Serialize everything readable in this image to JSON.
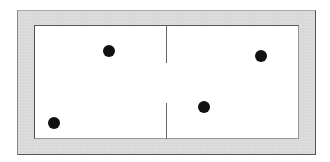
{
  "diagram": {
    "colors": {
      "frame": "#d9d9d9",
      "field": "#ffffff",
      "dot": "#111111",
      "divider": "#666666"
    },
    "divider": {
      "x": 166,
      "segments": [
        {
          "y1": 25,
          "y2": 63
        },
        {
          "y1": 103,
          "y2": 139
        }
      ]
    },
    "dots": [
      {
        "label": "dot-upper-left-half",
        "cx": 109,
        "cy": 51,
        "r": 6
      },
      {
        "label": "dot-upper-right",
        "cx": 261,
        "cy": 56,
        "r": 6
      },
      {
        "label": "dot-lower-right-half",
        "cx": 204,
        "cy": 107,
        "r": 6
      },
      {
        "label": "dot-lower-left",
        "cx": 54,
        "cy": 123,
        "r": 6
      }
    ]
  }
}
